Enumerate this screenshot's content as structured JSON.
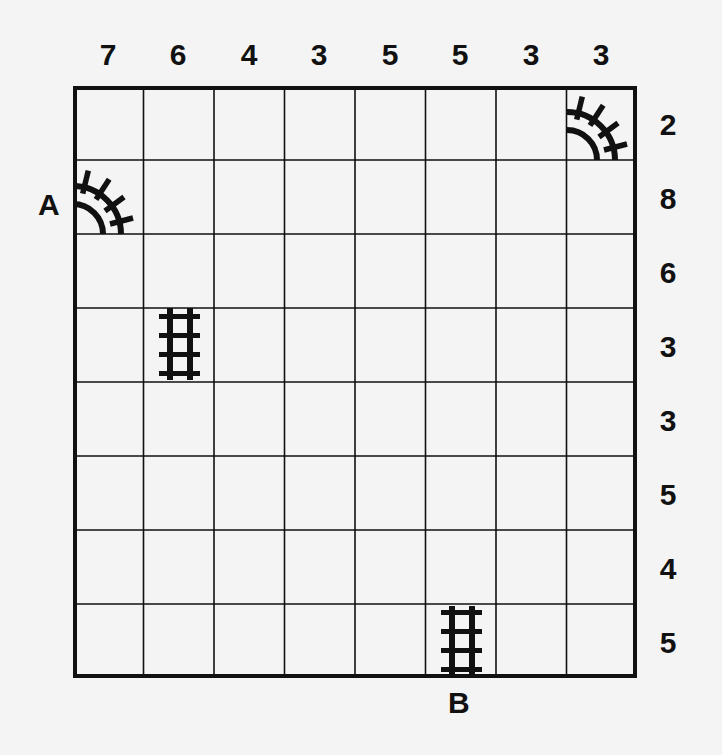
{
  "puzzle": {
    "size": 8,
    "column_clues": [
      "7",
      "6",
      "4",
      "3",
      "5",
      "5",
      "3",
      "3"
    ],
    "row_clues": [
      "2",
      "8",
      "6",
      "3",
      "3",
      "5",
      "4",
      "5"
    ],
    "endpoints": {
      "start": {
        "label": "A",
        "side": "left",
        "row": 1
      },
      "end": {
        "label": "B",
        "side": "bottom",
        "col": 5
      }
    },
    "given_tracks": [
      {
        "row": 0,
        "col": 7,
        "type": "curve-left-bottom"
      },
      {
        "row": 1,
        "col": 0,
        "type": "curve-left-bottom"
      },
      {
        "row": 3,
        "col": 1,
        "type": "straight-vertical"
      },
      {
        "row": 7,
        "col": 5,
        "type": "straight-vertical"
      }
    ],
    "colors": {
      "background": "#f4f4f4",
      "grid_lines": "#111111",
      "track": "#111111"
    }
  }
}
